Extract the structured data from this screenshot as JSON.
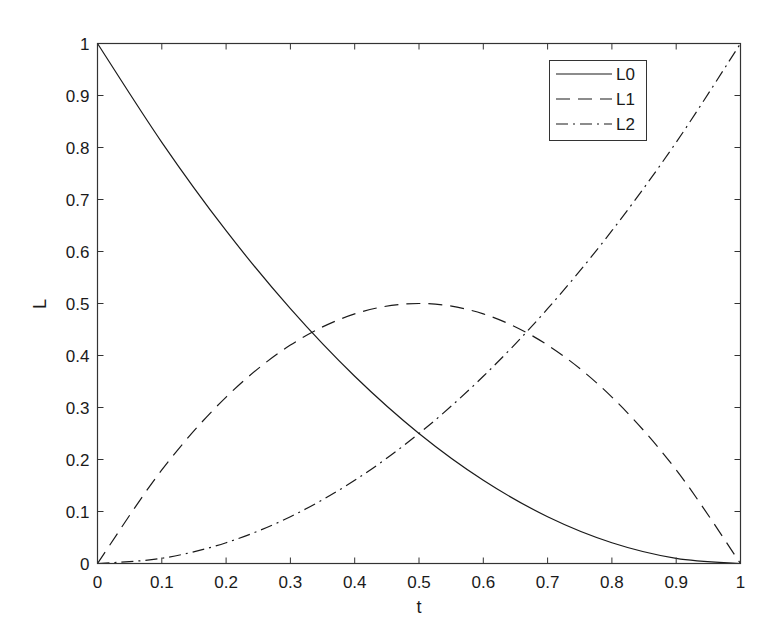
{
  "chart_data": {
    "type": "line",
    "title": "",
    "xlabel": "t",
    "ylabel": "L",
    "xlim": [
      0,
      1
    ],
    "ylim": [
      0,
      1
    ],
    "grid": false,
    "legend_position": "upper right",
    "xticks": [
      "0",
      "0.1",
      "0.2",
      "0.3",
      "0.4",
      "0.5",
      "0.6",
      "0.7",
      "0.8",
      "0.9",
      "1"
    ],
    "yticks": [
      "0",
      "0.1",
      "0.2",
      "0.3",
      "0.4",
      "0.5",
      "0.6",
      "0.7",
      "0.8",
      "0.9",
      "1"
    ],
    "x": [
      0,
      0.1,
      0.2,
      0.3,
      0.4,
      0.5,
      0.6,
      0.7,
      0.8,
      0.9,
      1.0
    ],
    "series": [
      {
        "name": "L0",
        "style": "solid",
        "values": [
          1.0,
          0.81,
          0.64,
          0.49,
          0.36,
          0.25,
          0.16,
          0.09,
          0.04,
          0.01,
          0.0
        ]
      },
      {
        "name": "L1",
        "style": "dashed",
        "values": [
          0.0,
          0.18,
          0.32,
          0.42,
          0.48,
          0.5,
          0.48,
          0.42,
          0.32,
          0.18,
          0.0
        ]
      },
      {
        "name": "L2",
        "style": "dashdot",
        "values": [
          0.0,
          0.01,
          0.04,
          0.09,
          0.16,
          0.25,
          0.36,
          0.49,
          0.64,
          0.81,
          1.0
        ]
      }
    ]
  },
  "colors": {
    "line": "#1a1a1a",
    "axes": "#333333",
    "background": "#ffffff"
  }
}
